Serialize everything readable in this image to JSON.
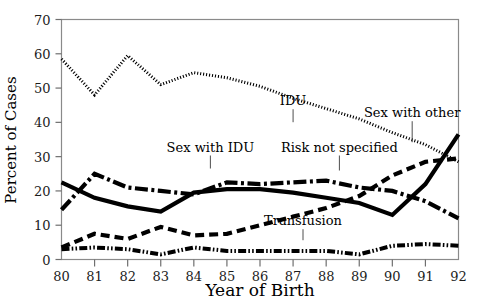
{
  "figure": {
    "background_color": "#ffffff",
    "frame_color": "#8a8a8a",
    "ink_color": "#000000"
  },
  "axis_titles": {
    "x": "Year of Birth",
    "y": "Percent of Cases"
  },
  "series_labels": {
    "idu": "IDU",
    "sex_with_idu": "Sex with IDU",
    "sex_with_other": "Sex with other",
    "risk_not_specified": "Risk not specified",
    "transfusion": "Transfusion"
  },
  "ticks": {
    "y": [
      "0",
      "10",
      "20",
      "30",
      "40",
      "50",
      "60",
      "70"
    ],
    "x": [
      "80",
      "81",
      "82",
      "83",
      "84",
      "85",
      "86",
      "87",
      "88",
      "89",
      "90",
      "91",
      "92"
    ]
  },
  "chart_data": {
    "type": "line",
    "title": "",
    "subtitle": "",
    "xlabel": "Year of Birth",
    "ylabel": "Percent of Cases",
    "xlim": [
      80,
      92
    ],
    "ylim": [
      0,
      70
    ],
    "yticks": [
      0,
      10,
      20,
      30,
      40,
      50,
      60,
      70
    ],
    "grid": false,
    "legend": "inline-annotations",
    "x": [
      80,
      81,
      82,
      83,
      84,
      85,
      86,
      87,
      88,
      89,
      90,
      91,
      92
    ],
    "series": [
      {
        "name": "IDU",
        "style": "dotted",
        "label_position": {
          "x": 87,
          "y": 45
        },
        "values": [
          58.5,
          48.0,
          59.5,
          51.0,
          54.5,
          53.0,
          50.5,
          47.0,
          44.0,
          41.0,
          37.0,
          33.5,
          28.5
        ]
      },
      {
        "name": "Sex with IDU",
        "style": "dash-dot",
        "label_position": {
          "x": 84.5,
          "y": 31.5
        },
        "values": [
          14.5,
          25.0,
          21.0,
          20.0,
          19.0,
          22.5,
          22.0,
          22.5,
          23.0,
          21.0,
          20.0,
          17.0,
          12.0
        ]
      },
      {
        "name": "Sex with other",
        "style": "solid",
        "label_position": {
          "x": 90.6,
          "y": 41.5
        },
        "values": [
          22.5,
          18.0,
          15.5,
          14.0,
          19.5,
          20.5,
          20.5,
          19.5,
          18.0,
          16.5,
          13.0,
          22.0,
          36.5
        ]
      },
      {
        "name": "Risk not specified",
        "style": "dashed",
        "label_position": {
          "x": 88.4,
          "y": 31.5
        },
        "values": [
          3.5,
          7.5,
          6.0,
          9.5,
          7.0,
          7.5,
          10.0,
          12.5,
          15.0,
          18.5,
          24.5,
          28.5,
          29.5
        ]
      },
      {
        "name": "Transfusion",
        "style": "dash-dot-dot",
        "label_position": {
          "x": 87.3,
          "y": 10.0
        },
        "values": [
          3.0,
          3.5,
          3.0,
          1.5,
          3.5,
          2.5,
          2.5,
          2.5,
          2.5,
          1.5,
          4.0,
          4.5,
          4.0
        ]
      }
    ]
  }
}
